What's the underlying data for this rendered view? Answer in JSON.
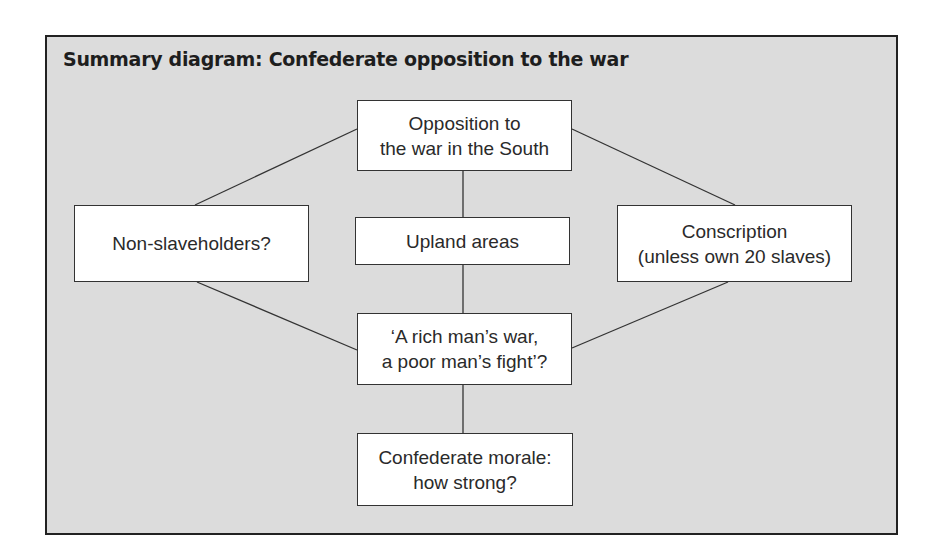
{
  "diagram": {
    "title": "Summary diagram: Confederate opposition to the war",
    "nodes": {
      "top": {
        "line1": "Opposition to",
        "line2": "the war in the South"
      },
      "left": {
        "line1": "Non-slaveholders?"
      },
      "right": {
        "line1": "Conscription",
        "line2": "(unless own 20 slaves)"
      },
      "upland": {
        "line1": "Upland areas"
      },
      "rich": {
        "line1": "‘A rich man’s war,",
        "line2": "a poor man’s fight’?"
      },
      "morale": {
        "line1": "Confederate morale:",
        "line2": "how strong?"
      }
    },
    "edges": [
      [
        "top",
        "left"
      ],
      [
        "top",
        "right"
      ],
      [
        "top",
        "upland"
      ],
      [
        "upland",
        "rich"
      ],
      [
        "left",
        "rich"
      ],
      [
        "right",
        "rich"
      ],
      [
        "rich",
        "morale"
      ]
    ],
    "colors": {
      "background": "#dcdcdc",
      "box": "#ffffff",
      "border": "#222222",
      "text": "#2a2a2a"
    }
  }
}
